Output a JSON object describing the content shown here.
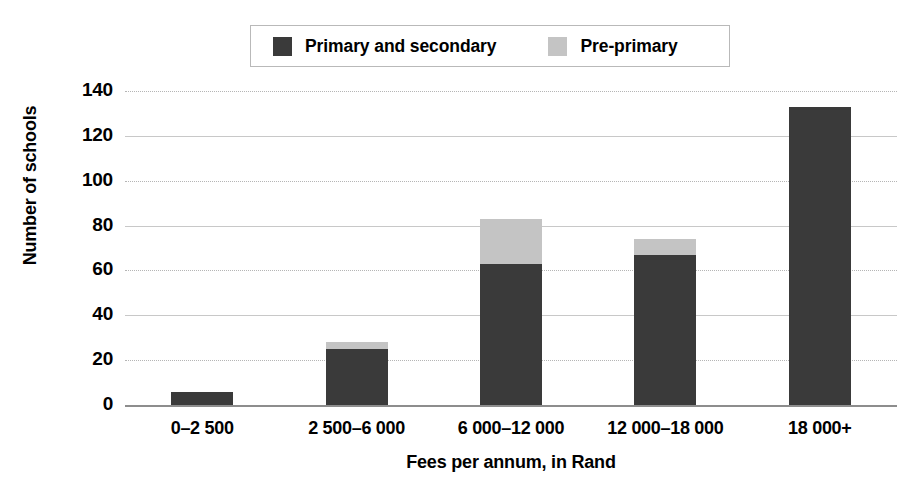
{
  "chart_data": {
    "type": "bar",
    "stacked": true,
    "title": "",
    "xlabel": "Fees per annum, in Rand",
    "ylabel": "Number of schools",
    "categories": [
      "0–2 500",
      "2 500–6 000",
      "6 000–12 000",
      "12 000–18 000",
      "18 000+"
    ],
    "series": [
      {
        "name": "Primary and secondary",
        "color": "#3a3a3a",
        "values": [
          6,
          25,
          63,
          67,
          133
        ]
      },
      {
        "name": "Pre-primary",
        "color": "#c4c4c4",
        "values": [
          0,
          3,
          20,
          7,
          0
        ]
      }
    ],
    "totals": [
      6,
      28,
      83,
      74,
      133
    ],
    "ylim": [
      0,
      140
    ],
    "ytick_values": [
      140,
      120,
      100,
      80,
      60,
      40,
      20,
      0
    ],
    "ytick_labels": [
      "140",
      "120",
      "100",
      "80",
      "60",
      "40",
      "20",
      "0"
    ],
    "grid": "horizontal",
    "legend_position": "top-center"
  },
  "legend": {
    "entries": [
      {
        "label": "Primary and secondary",
        "color": "#3a3a3a"
      },
      {
        "label": "Pre-primary",
        "color": "#c4c4c4"
      }
    ]
  },
  "colors": {
    "primary_secondary": "#3a3a3a",
    "pre_primary": "#c4c4c4",
    "gridline": "#c8c8c8",
    "axis": "#8d8d8d",
    "background": "#ffffff",
    "text": "#000000"
  }
}
